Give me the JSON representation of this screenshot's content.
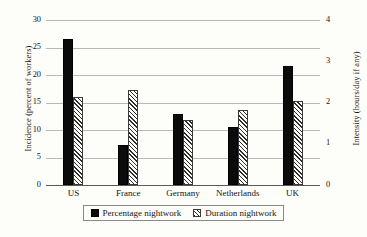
{
  "chart_data": {
    "type": "bar",
    "title": "",
    "subtitle": "",
    "categories": [
      "US",
      "France",
      "Germany",
      "Netherlands",
      "UK"
    ],
    "series": [
      {
        "name": "Percentage nightwork",
        "axis": "left",
        "unit": "percent of workers",
        "fill": "solid-black",
        "values": [
          26.6,
          7.3,
          13.0,
          10.5,
          21.7
        ]
      },
      {
        "name": "Duration nightwork",
        "axis": "right",
        "unit": "hours/day if any",
        "fill": "diagonal-hatch",
        "values": [
          2.13,
          2.31,
          1.58,
          1.83,
          2.03
        ]
      }
    ],
    "left_axis": {
      "label": "Incidence (percent of workers)",
      "ticks": [
        0,
        5,
        10,
        15,
        20,
        25,
        30
      ],
      "ylim": [
        0,
        30
      ]
    },
    "right_axis": {
      "label": "Intensity (hours/day if any)",
      "ticks": [
        0,
        1,
        2,
        3,
        4
      ],
      "ylim": [
        0,
        4
      ]
    },
    "xlabel": "",
    "grid": true,
    "legend_position": "bottom-center",
    "legend": [
      {
        "label": "Percentage nightwork",
        "swatch": "solid"
      },
      {
        "label": "Duration nightwork",
        "swatch": "hatch"
      }
    ],
    "colors": {
      "bar_solid": "#0b0b0b",
      "bar_hatch_line": "#2e2e2e",
      "gridline": "#b9b9b9",
      "baseline": "#5a5a5a",
      "background": "#fdfdfa",
      "text": "#141414"
    }
  }
}
